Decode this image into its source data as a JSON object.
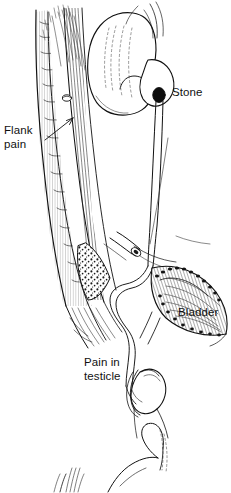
{
  "figure": {
    "background_color": "#ffffff",
    "ink_color": "#111111",
    "style": "black-and-white medical line drawing with hatching and stippling"
  },
  "labels": {
    "flank_pain": "Flank\npain",
    "stone": "Stone",
    "bladder": "Bladder",
    "pain_in_testicle": "Pain in\ntesticle"
  },
  "structures": [
    {
      "name": "spine",
      "label": ""
    },
    {
      "name": "kidney",
      "label": ""
    },
    {
      "name": "renal-pelvis",
      "label": ""
    },
    {
      "name": "ureter",
      "label": ""
    },
    {
      "name": "stone",
      "label": "Stone"
    },
    {
      "name": "bladder",
      "label": "Bladder"
    },
    {
      "name": "testicle",
      "label": "Pain in testicle"
    },
    {
      "name": "cut-ureter-stump",
      "label": ""
    },
    {
      "name": "partial-figure-below",
      "label": ""
    }
  ]
}
